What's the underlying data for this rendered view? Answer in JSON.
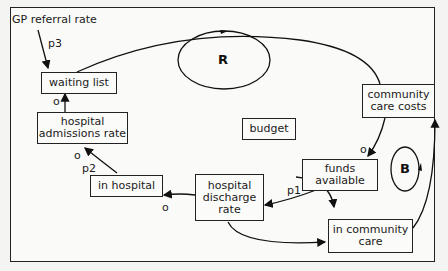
{
  "diagram": {
    "type": "causal-loop",
    "nodes": {
      "waiting_list": "waiting list",
      "hospital_admissions_rate": "hospital admissions rate",
      "in_hospital": "in hospital",
      "hospital_discharge_rate": "hospital discharge rate",
      "budget": "budget",
      "funds_available": "funds available",
      "community_care_costs": "community care costs",
      "in_community_care": "in community care"
    },
    "node_lines": {
      "hospital_admissions_rate": [
        "hospital",
        "admissions rate"
      ],
      "hospital_discharge_rate": [
        "hospital",
        "discharge",
        "rate"
      ],
      "funds_available": [
        "funds",
        "available"
      ],
      "community_care_costs": [
        "community",
        "care costs"
      ],
      "in_community_care": [
        "in community",
        "care"
      ]
    },
    "external_input": "GP referral rate",
    "parameters": {
      "p1": "p1",
      "p2": "p2",
      "p3": "p3"
    },
    "polarity_markers": {
      "waiting_list_from_admissions": "o",
      "admissions_from_in_hospital": "o",
      "in_hospital_from_discharge": "o",
      "funds_from_costs": "o"
    },
    "loops": {
      "reinforcing": "R",
      "balancing": "B"
    }
  }
}
